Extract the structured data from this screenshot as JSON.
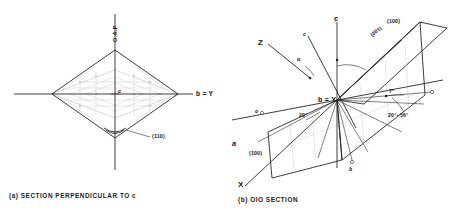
{
  "figure": {
    "line_color": "#1b1b1b",
    "faint_color": "#bfbfbf",
    "background": "#ffffff"
  },
  "panel_a": {
    "caption": "(a) SECTION PERPENDICULAR TO c",
    "vertical_axis_label": "O.A.P",
    "horizontal_axis_label": "b = Y",
    "center_label": "c",
    "plane_label": "(110)",
    "shape": "rhombus"
  },
  "panel_b": {
    "caption": "(b) OIO SECTION",
    "axis_c_label": "c",
    "axis_c_prime_label": "c",
    "axis_Z_label": "Z",
    "axis_X_label": "X",
    "axis_a_label": "a",
    "origin_label": "b = Y",
    "plane_100_label": "(100)",
    "plane_001_label": "(001)",
    "plane_100_lower_label": "(100)",
    "angle_alpha_label": "α",
    "angle_left_label": "20°",
    "angle_top_label": "7°",
    "angle_range_label": "20°- 56°",
    "marker_o_left": "o",
    "marker_o_right": "o",
    "marker_b_lower": "b"
  }
}
